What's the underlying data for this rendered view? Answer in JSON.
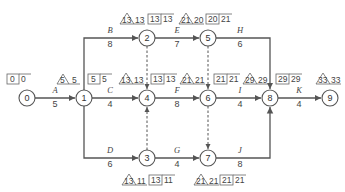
{
  "diagram": {
    "type": "activity-on-arrow network (critical path)",
    "colors": {
      "line": "#555555",
      "text": "#444444",
      "background": "#ffffff"
    },
    "nodes": [
      {
        "id": "0",
        "label": "0",
        "x": 27,
        "y": 98
      },
      {
        "id": "1",
        "label": "1",
        "x": 84,
        "y": 98
      },
      {
        "id": "2",
        "label": "2",
        "x": 147,
        "y": 38
      },
      {
        "id": "3",
        "label": "3",
        "x": 147,
        "y": 158
      },
      {
        "id": "4",
        "label": "4",
        "x": 147,
        "y": 98
      },
      {
        "id": "5",
        "label": "5",
        "x": 208,
        "y": 38
      },
      {
        "id": "6",
        "label": "6",
        "x": 208,
        "y": 98
      },
      {
        "id": "7",
        "label": "7",
        "x": 208,
        "y": 158
      },
      {
        "id": "8",
        "label": "8",
        "x": 270,
        "y": 98
      },
      {
        "id": "9",
        "label": "9",
        "x": 330,
        "y": 98
      }
    ],
    "activities": [
      {
        "name": "A",
        "duration": "5",
        "from": "0",
        "to": "1"
      },
      {
        "name": "B",
        "duration": "8",
        "from": "1",
        "to": "2"
      },
      {
        "name": "C",
        "duration": "4",
        "from": "1",
        "to": "4"
      },
      {
        "name": "D",
        "duration": "6",
        "from": "1",
        "to": "3"
      },
      {
        "name": "E",
        "duration": "7",
        "from": "2",
        "to": "5"
      },
      {
        "name": "F",
        "duration": "8",
        "from": "4",
        "to": "6"
      },
      {
        "name": "G",
        "duration": "4",
        "from": "3",
        "to": "7"
      },
      {
        "name": "H",
        "duration": "6",
        "from": "5",
        "to": "8"
      },
      {
        "name": "I",
        "duration": "4",
        "from": "6",
        "to": "8"
      },
      {
        "name": "J",
        "duration": "8",
        "from": "7",
        "to": "8"
      },
      {
        "name": "K",
        "duration": "4",
        "from": "8",
        "to": "9"
      }
    ],
    "dummies": [
      {
        "from": "2",
        "to": "4"
      },
      {
        "from": "3",
        "to": "4"
      },
      {
        "from": "5",
        "to": "6"
      },
      {
        "from": "6",
        "to": "7"
      }
    ],
    "time_labels": {
      "node0": {
        "tri": "",
        "tri_val": "",
        "box": "0",
        "box_val": "0"
      },
      "node1": {
        "tri": "5",
        "tri_val": "5",
        "box": "5",
        "box_val": "5"
      },
      "node2": {
        "tri": "13",
        "tri_val": "13",
        "box": "13",
        "box_val": "13"
      },
      "node4": {
        "tri": "13",
        "tri_val": "13",
        "box": "13",
        "box_val": "13"
      },
      "node5": {
        "tri": "21",
        "tri_val": "20",
        "box": "20",
        "box_val": "21"
      },
      "node6": {
        "tri": "21",
        "tri_val": "21",
        "box": "21",
        "box_val": "21"
      },
      "node8": {
        "tri": "29",
        "tri_val": "29",
        "box": "29",
        "box_val": "29"
      },
      "node9": {
        "tri": "33",
        "tri_val": "33",
        "box": "",
        "box_val": ""
      },
      "node3": {
        "tri": "13",
        "tri_val": "11",
        "box": "13",
        "box_val": "11"
      },
      "node7": {
        "tri": "21",
        "tri_val": "21",
        "box": "21",
        "box_val": "21"
      }
    }
  }
}
